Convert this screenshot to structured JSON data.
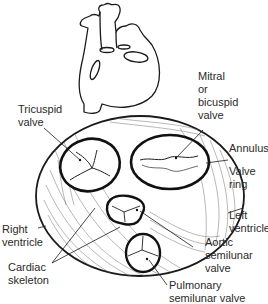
{
  "diagram": {
    "line_color": "#1a1a1a",
    "hatch_color": "#6a6a6a",
    "background": "#ffffff"
  },
  "labels": {
    "tricuspid": "Tricuspid\nvalve",
    "mitral": "Mitral\nor\nbicuspid\nvalve",
    "annulus": "Annulus",
    "valve_ring": "Valve\nring",
    "left_ventricle": "Left\nventricle",
    "right_ventricle": "Right\nventricle",
    "aortic": "Aortic\nsemilunar\nvalve",
    "cardiac_skeleton": "Cardiac\nskeleton",
    "pulmonary": "Pulmonary\nsemilunar valve"
  }
}
